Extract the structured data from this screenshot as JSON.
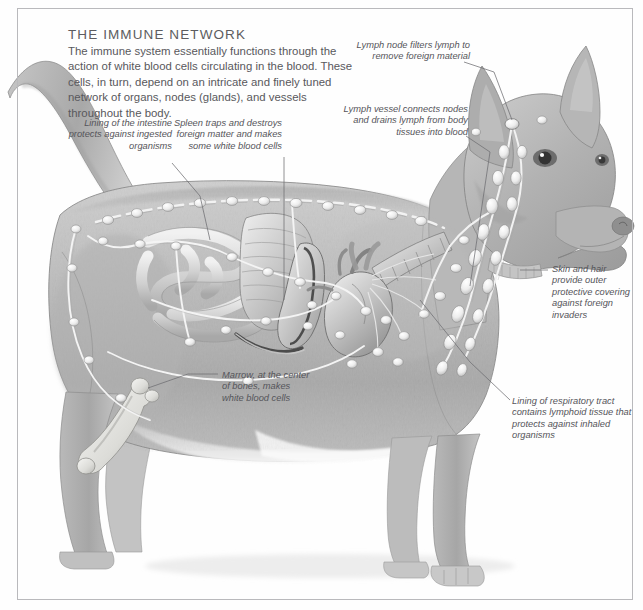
{
  "page": {
    "width": 643,
    "height": 610,
    "background": "#fefefe",
    "frame_color": "#b9b9bc",
    "text_color": "#55555a",
    "title_color": "#5c5c60"
  },
  "header": {
    "title": "THE IMMUNE NETWORK",
    "intro": "The immune system essentially functions through the action of white blood cells circulating in the blood. These cells, in turn, depend on an intricate and finely tuned network of organs, nodes (glands), and vessels throughout the body."
  },
  "callouts": [
    {
      "id": "intestine",
      "text": "Lining of the intestine protects against ingested organisms",
      "align": "right"
    },
    {
      "id": "spleen",
      "text": "Spleen traps and destroys foreign matter and makes some white blood cells",
      "align": "right"
    },
    {
      "id": "lymph-node",
      "text": "Lymph node filters lymph to remove foreign material",
      "align": "right"
    },
    {
      "id": "lymph-vessel",
      "text": "Lymph vessel connects nodes and drains lymph from body tissues into blood",
      "align": "right"
    },
    {
      "id": "skin",
      "text": "Skin and hair provide outer protective covering against foreign invaders",
      "align": "left"
    },
    {
      "id": "respiratory",
      "text": "Lining of respiratory tract contains lymphoid tissue that protects against inhaled organisms",
      "align": "left"
    },
    {
      "id": "marrow",
      "text": "Marrow, at the center of bones, makes white blood cells",
      "align": "left"
    }
  ],
  "illustration": {
    "subject": "dog-anatomy-lymphatic-system",
    "description": "Pencil-style grayscale drawing of a standing dog shown in left profile with the lymphatic network, intestines, stomach, spleen, heart, lungs, trachea and femur rendered inside the body.",
    "organs": [
      "intestine",
      "stomach",
      "spleen",
      "heart",
      "lungs",
      "trachea",
      "femur-bone",
      "lymph-nodes",
      "lymph-vessels"
    ],
    "palette": {
      "fur_light": "#d7d7d7",
      "fur_mid": "#b4b4b4",
      "fur_dark": "#8e8e8e",
      "outline": "#6f6f6f",
      "node_fill": "#efefef",
      "vessel": "#f4f4f4",
      "organ_light": "#e2e2e2",
      "organ_dark": "#9a9a9a"
    }
  }
}
